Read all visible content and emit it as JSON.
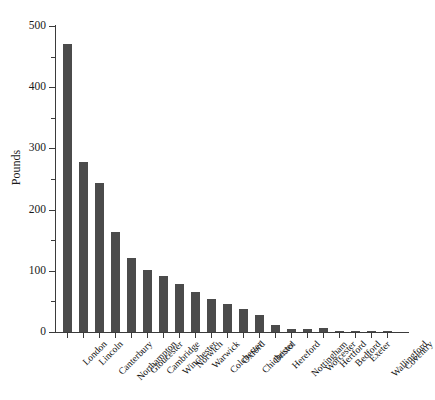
{
  "header": {
    "faint_text": "",
    "faint_right": ""
  },
  "chart_data": {
    "type": "bar",
    "title": "",
    "xlabel": "",
    "ylabel": "Pounds",
    "ylim": [
      0,
      500
    ],
    "y_major_ticks": [
      0,
      100,
      200,
      300,
      400,
      500
    ],
    "y_minor_ticks": [
      50,
      150,
      250,
      350,
      450
    ],
    "grid": false,
    "legend": "none",
    "bar_color": "#4b4b4b",
    "axis_color": "#3b3b3b",
    "categories": [
      "London",
      "Lincoln",
      "Canterbury",
      "Northampton",
      "Gloucester",
      "Cambridge",
      "Winchester",
      "Norwich",
      "Warwick",
      "Colchester",
      "Oxford",
      "Chichester",
      "Bristol",
      "Hereford",
      "Nottingham",
      "Worcester",
      "Hertford",
      "Bedford",
      "Exeter",
      "Wallingford",
      "Coventry"
    ],
    "values": [
      470,
      277,
      243,
      163,
      121,
      102,
      92,
      78,
      65,
      54,
      45,
      38,
      28,
      12,
      5,
      5,
      6,
      2,
      1,
      1,
      1
    ]
  }
}
